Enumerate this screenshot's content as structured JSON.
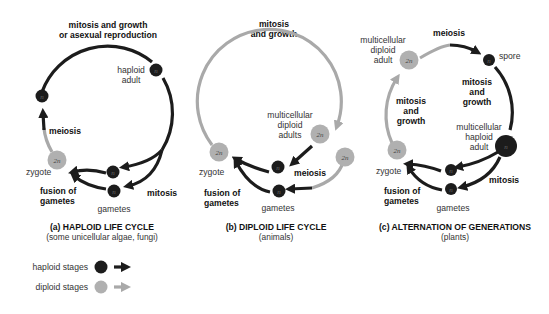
{
  "colors": {
    "haploid": "#1c1c1c",
    "diploid": "#a9a9a9",
    "diploid_cell": "#b0b0b0",
    "background": "#ffffff"
  },
  "panels": [
    {
      "id": "a",
      "title": "(a) HAPLOID LIFE CYCLE",
      "subtitle": "(some unicellular algae, fungi)",
      "labels": {
        "top": [
          "mitosis and growth",
          "or asexual reproduction"
        ],
        "adult": [
          "haploid",
          "adult"
        ],
        "meiosis": "meiosis",
        "zygote": "zygote",
        "fusion": [
          "fusion of",
          "gametes"
        ],
        "gametes": "gametes",
        "mitosis": "mitosis"
      },
      "cells": {
        "adult": "n",
        "post_meiosis": "n",
        "zygote": "2n",
        "gamete1": "n",
        "gamete2": "n"
      }
    },
    {
      "id": "b",
      "title": "(b) DIPLOID LIFE CYCLE",
      "subtitle": "(animals)",
      "labels": {
        "top": [
          "mitosis",
          "and growth"
        ],
        "adults": [
          "multicellular",
          "diploid",
          "adults"
        ],
        "meiosis": "meiosis",
        "zygote": "zygote",
        "fusion": [
          "fusion of",
          "gametes"
        ],
        "gametes": "gametes"
      },
      "cells": {
        "adult1": "2n",
        "adult2": "2n",
        "zygote": "2n",
        "gamete1": "n",
        "gamete2": "n"
      }
    },
    {
      "id": "c",
      "title": "(c) ALTERNATION OF GENERATIONS",
      "subtitle": "(plants)",
      "labels": {
        "diploid_adult": [
          "multicellular",
          "diploid",
          "adult"
        ],
        "meiosis": "meiosis",
        "spore": "spore",
        "right_mitosis": [
          "mitosis",
          "and",
          "growth"
        ],
        "left_mitosis": [
          "mitosis",
          "and",
          "growth"
        ],
        "haploid_adult": [
          "multicellular",
          "haploid",
          "adult"
        ],
        "zygote": "zygote",
        "fusion": [
          "fusion of",
          "gametes"
        ],
        "gametes": "gametes",
        "mitosis": "mitosis"
      },
      "cells": {
        "diploid_adult": "2n",
        "spore": "n",
        "haploid_adult": "n",
        "zygote": "2n",
        "gamete1": "n",
        "gamete2": "n"
      }
    }
  ],
  "legend": {
    "haploid": "haploid stages",
    "diploid": "diploid stages"
  }
}
